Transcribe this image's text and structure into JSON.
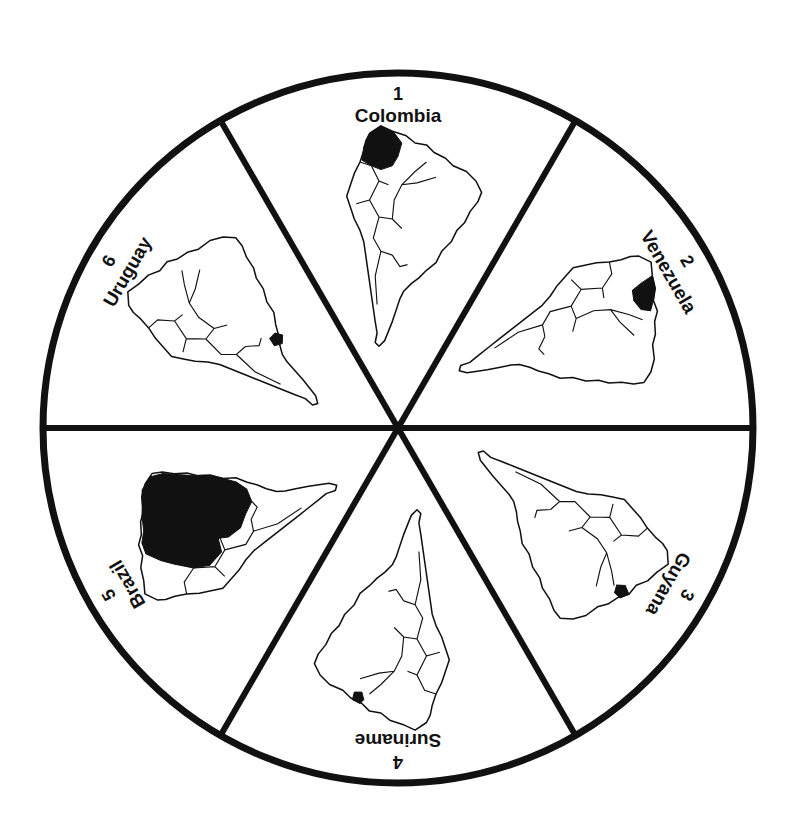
{
  "diagram": {
    "type": "wheel",
    "center": [
      398,
      428
    ],
    "radius": 355,
    "colors": {
      "stroke": "#111111",
      "highlight": "#111111",
      "background": "#ffffff"
    },
    "sectors": [
      {
        "number": "1",
        "country": "Colombia",
        "rotation": 0
      },
      {
        "number": "2",
        "country": "Venezuela",
        "rotation": 60
      },
      {
        "number": "3",
        "country": "Guyana",
        "rotation": 120
      },
      {
        "number": "4",
        "country": "Suriname",
        "rotation": 180
      },
      {
        "number": "5",
        "country": "Brazil",
        "rotation": 240
      },
      {
        "number": "6",
        "country": "Uruguay",
        "rotation": 300
      }
    ]
  }
}
